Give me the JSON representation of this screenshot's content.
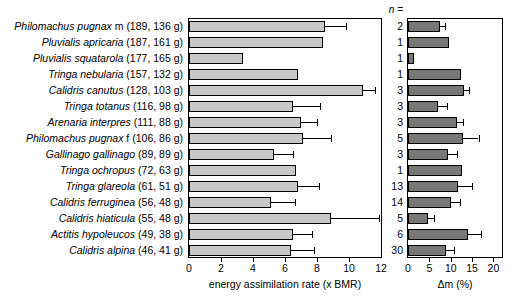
{
  "chart_data": {
    "type": "bar",
    "orientation": "horizontal",
    "title": "",
    "grid": false,
    "legend": null,
    "categories": [
      "Philomachus pugnax m (189, 136 g)",
      "Pluvialis apricaria (187, 161 g)",
      "Pluvialis squatarola (177, 165 g)",
      "Tringa nebularia (157, 132 g)",
      "Calidris canutus (128, 103 g)",
      "Tringa totanus (116, 98 g)",
      "Arenaria interpres (111, 88 g)",
      "Philomachus pugnax f (106, 86 g)",
      "Gallinago gallinago (89, 89 g)",
      "Tringa ochropus (72, 63 g)",
      "Tringa glareola (61, 51 g)",
      "Calidris ferruginea (56, 48 g)",
      "Calidris hiaticula (55, 48 g)",
      "Actitis hypoleucos (49, 38 g)",
      "Calidris alpina (46, 41 g)"
    ],
    "label_parts": [
      {
        "sci": "Philomachus pugnax",
        "rest": " m (189, 136 g)"
      },
      {
        "sci": "Pluvialis apricaria",
        "rest": " (187, 161 g)"
      },
      {
        "sci": "Pluvialis squatarola",
        "rest": " (177, 165 g)"
      },
      {
        "sci": "Tringa nebularia",
        "rest": " (157, 132 g)"
      },
      {
        "sci": "Calidris canutus",
        "rest": " (128, 103 g)"
      },
      {
        "sci": "Tringa totanus",
        "rest": " (116, 98 g)"
      },
      {
        "sci": "Arenaria interpres",
        "rest": " (111, 88 g)"
      },
      {
        "sci": "Philomachus pugnax",
        "rest": " f (106, 86 g)"
      },
      {
        "sci": "Gallinago gallinago",
        "rest": " (89, 89 g)"
      },
      {
        "sci": "Tringa ochropus",
        "rest": " (72, 63 g)"
      },
      {
        "sci": "Tringa glareola",
        "rest": " (61, 51 g)"
      },
      {
        "sci": "Calidris ferruginea",
        "rest": " (56, 48 g)"
      },
      {
        "sci": "Calidris hiaticula",
        "rest": " (55, 48 g)"
      },
      {
        "sci": "Actitis hypoleucos",
        "rest": " (49, 38 g)"
      },
      {
        "sci": "Calidris alpina",
        "rest": " (46, 41 g)"
      }
    ],
    "n_header": "n =",
    "n_values": [
      2,
      1,
      1,
      1,
      3,
      3,
      3,
      5,
      3,
      1,
      13,
      14,
      5,
      6,
      30
    ],
    "panels": [
      {
        "id": "energy",
        "xlabel": "energy assimilation rate (x BMR)",
        "xlim": [
          0,
          12
        ],
        "xticks": [
          0,
          2,
          4,
          6,
          8,
          10,
          12
        ],
        "bar_color": "#c8c8c8",
        "values": [
          8.5,
          8.4,
          3.4,
          6.8,
          10.9,
          6.5,
          7.0,
          7.1,
          5.3,
          6.7,
          6.8,
          5.1,
          8.9,
          6.5,
          6.4
        ],
        "errors": [
          1.3,
          0,
          0,
          0,
          0.7,
          1.7,
          1.0,
          1.8,
          1.2,
          0,
          1.3,
          1.5,
          3.0,
          1.2,
          1.4
        ]
      },
      {
        "id": "delta-m",
        "xlabel": "Δm (%)",
        "xlim": [
          0,
          22
        ],
        "xticks": [
          0,
          5,
          10,
          15,
          20
        ],
        "bar_color": "#777777",
        "values": [
          7.4,
          9.6,
          1.5,
          12.4,
          13.0,
          7.0,
          11.4,
          12.9,
          9.4,
          12.7,
          11.8,
          10.0,
          4.7,
          14.0,
          9.0
        ],
        "errors": [
          1.2,
          0,
          0,
          0,
          1.3,
          2.1,
          1.4,
          3.6,
          2.0,
          0,
          3.2,
          2.2,
          1.4,
          3.0,
          1.8
        ]
      }
    ]
  }
}
